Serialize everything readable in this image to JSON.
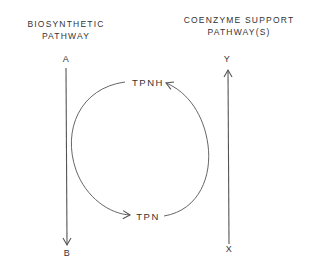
{
  "diagram": {
    "left_heading": [
      "BIOSYNTHETIC",
      "PATHWAY"
    ],
    "right_heading": [
      "COENZYME SUPPORT",
      "PATHWAY(S)"
    ],
    "biosynthetic": {
      "from": "A",
      "to": "B",
      "direction": "down"
    },
    "support": {
      "from": "X",
      "to": "Y",
      "direction": "up"
    },
    "cycle": {
      "top": "TPNH",
      "bottom": "TPN",
      "direction": "TPNH → TPN via left arc; TPN → TPNH via right arc"
    },
    "colors": {
      "line": "#555555",
      "text": "#333333",
      "background": "#ffffff"
    }
  }
}
